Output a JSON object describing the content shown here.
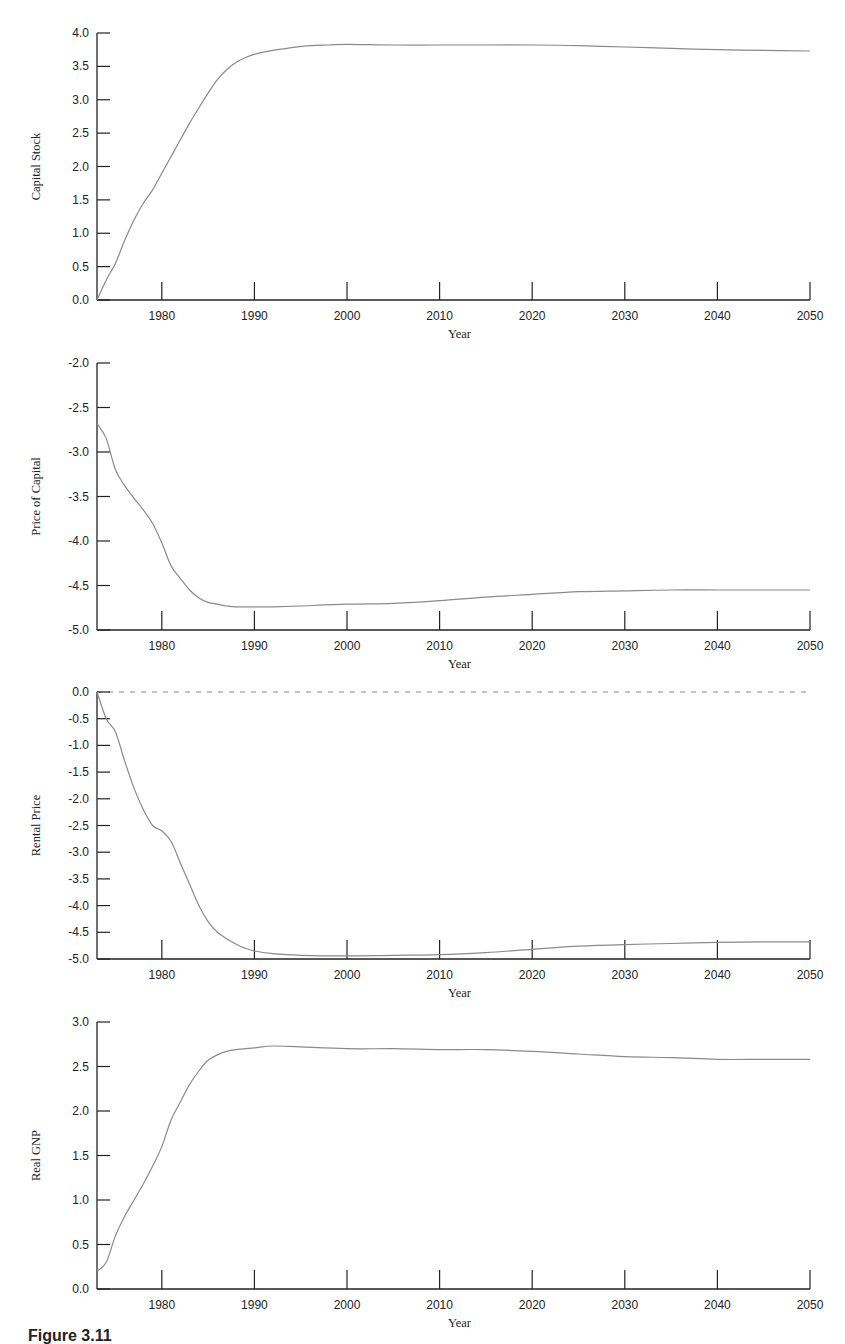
{
  "caption": "Figure 3.11",
  "colors": {
    "axis": "#222222",
    "line": "#8a8a8a",
    "zero_line": "#888888"
  },
  "chart_data": [
    {
      "type": "line",
      "title": "",
      "xlabel": "Year",
      "ylabel": "Capital Stock",
      "xlim": [
        1973,
        2050
      ],
      "ylim": [
        0.0,
        4.0
      ],
      "xticks": [
        1980,
        1990,
        2000,
        2010,
        2020,
        2030,
        2040,
        2050
      ],
      "yticks": [
        "0.0",
        "0.5",
        "1.0",
        "1.5",
        "2.0",
        "2.5",
        "3.0",
        "3.5",
        "4.0"
      ],
      "grid": false,
      "zero_line": false,
      "x": [
        1973,
        1974,
        1975,
        1976,
        1977,
        1978,
        1979,
        1980,
        1981,
        1982,
        1983,
        1984,
        1985,
        1986,
        1987,
        1988,
        1989,
        1990,
        1992,
        1994,
        1996,
        1998,
        2000,
        2005,
        2010,
        2015,
        2020,
        2025,
        2030,
        2035,
        2040,
        2045,
        2050
      ],
      "values": [
        0.0,
        0.3,
        0.55,
        0.9,
        1.2,
        1.45,
        1.65,
        1.9,
        2.15,
        2.4,
        2.65,
        2.88,
        3.1,
        3.3,
        3.45,
        3.56,
        3.63,
        3.68,
        3.74,
        3.78,
        3.81,
        3.82,
        3.83,
        3.82,
        3.82,
        3.82,
        3.82,
        3.81,
        3.79,
        3.77,
        3.75,
        3.74,
        3.73
      ]
    },
    {
      "type": "line",
      "title": "",
      "xlabel": "Year",
      "ylabel": "Price of Capital",
      "xlim": [
        1973,
        2050
      ],
      "ylim": [
        -5.0,
        -2.0
      ],
      "xticks": [
        1980,
        1990,
        2000,
        2010,
        2020,
        2030,
        2040,
        2050
      ],
      "yticks": [
        "-5.0",
        "-4.5",
        "-4.0",
        "-3.5",
        "-3.0",
        "-2.5",
        "-2.0"
      ],
      "grid": false,
      "zero_line": false,
      "x": [
        1973,
        1974,
        1975,
        1976,
        1977,
        1978,
        1979,
        1980,
        1981,
        1982,
        1983,
        1984,
        1985,
        1986,
        1987,
        1988,
        1990,
        1992,
        1995,
        2000,
        2005,
        2010,
        2015,
        2020,
        2025,
        2030,
        2035,
        2040,
        2045,
        2050
      ],
      "values": [
        -2.68,
        -2.85,
        -3.2,
        -3.38,
        -3.52,
        -3.65,
        -3.8,
        -4.02,
        -4.28,
        -4.42,
        -4.55,
        -4.64,
        -4.69,
        -4.71,
        -4.73,
        -4.74,
        -4.74,
        -4.74,
        -4.73,
        -4.71,
        -4.7,
        -4.67,
        -4.63,
        -4.6,
        -4.57,
        -4.56,
        -4.55,
        -4.55,
        -4.55,
        -4.55
      ]
    },
    {
      "type": "line",
      "title": "",
      "xlabel": "Year",
      "ylabel": "Rental Price",
      "xlim": [
        1973,
        2050
      ],
      "ylim": [
        -5.0,
        0.0
      ],
      "xticks": [
        1980,
        1990,
        2000,
        2010,
        2020,
        2030,
        2040,
        2050
      ],
      "yticks": [
        "-5.0",
        "-4.5",
        "-4.0",
        "-3.5",
        "-3.0",
        "-2.5",
        "-2.0",
        "-1.5",
        "-1.0",
        "-0.5",
        "0.0"
      ],
      "grid": false,
      "zero_line": true,
      "x": [
        1973,
        1974,
        1975,
        1976,
        1977,
        1978,
        1979,
        1980,
        1981,
        1982,
        1983,
        1984,
        1985,
        1986,
        1987,
        1988,
        1989,
        1990,
        1992,
        1995,
        2000,
        2005,
        2010,
        2015,
        2020,
        2025,
        2030,
        2035,
        2040,
        2045,
        2050
      ],
      "values": [
        0.0,
        -0.5,
        -0.75,
        -1.3,
        -1.8,
        -2.2,
        -2.5,
        -2.6,
        -2.8,
        -3.2,
        -3.6,
        -4.0,
        -4.3,
        -4.5,
        -4.62,
        -4.72,
        -4.8,
        -4.85,
        -4.9,
        -4.93,
        -4.94,
        -4.93,
        -4.92,
        -4.88,
        -4.82,
        -4.76,
        -4.73,
        -4.71,
        -4.69,
        -4.68,
        -4.68
      ]
    },
    {
      "type": "line",
      "title": "",
      "xlabel": "Year",
      "ylabel": "Real GNP",
      "xlim": [
        1973,
        2050
      ],
      "ylim": [
        0.0,
        3.0
      ],
      "xticks": [
        1980,
        1990,
        2000,
        2010,
        2020,
        2030,
        2040,
        2050
      ],
      "yticks": [
        "0.0",
        "0.5",
        "1.0",
        "1.5",
        "2.0",
        "2.5",
        "3.0"
      ],
      "grid": false,
      "zero_line": false,
      "x": [
        1973,
        1974,
        1975,
        1976,
        1977,
        1978,
        1979,
        1980,
        1981,
        1982,
        1983,
        1984,
        1985,
        1986,
        1987,
        1988,
        1990,
        1992,
        1995,
        2000,
        2005,
        2010,
        2015,
        2020,
        2025,
        2030,
        2035,
        2040,
        2045,
        2050
      ],
      "values": [
        0.2,
        0.3,
        0.6,
        0.82,
        1.0,
        1.18,
        1.38,
        1.6,
        1.9,
        2.1,
        2.3,
        2.45,
        2.57,
        2.63,
        2.67,
        2.69,
        2.71,
        2.73,
        2.72,
        2.7,
        2.7,
        2.69,
        2.69,
        2.67,
        2.64,
        2.61,
        2.6,
        2.58,
        2.58,
        2.58
      ]
    }
  ]
}
